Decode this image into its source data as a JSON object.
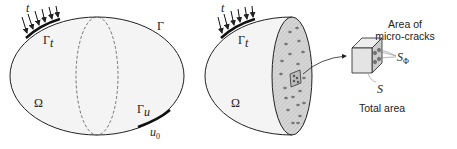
{
  "left_figure": {
    "load_label": "t",
    "traction_boundary": "Γ",
    "traction_boundary_sub": "t",
    "boundary": "Γ",
    "domain": "Ω",
    "displacement_boundary": "Γ",
    "displacement_boundary_sub": "u",
    "displacement_value": "u",
    "displacement_value_sub": "0"
  },
  "right_figure": {
    "load_label": "t",
    "traction_boundary": "Γ",
    "traction_boundary_sub": "t",
    "domain": "Ω",
    "microcrack_label_line1": "Area of",
    "microcrack_label_line2": "micro-cracks",
    "microcrack_symbol": "S",
    "microcrack_symbol_sub": "Φ",
    "total_symbol": "S",
    "total_label": "Total area"
  },
  "colors": {
    "fill": "#f4f4f4",
    "section_fill": "#cfcfcf",
    "stroke": "#222222",
    "dots": "#777777"
  }
}
